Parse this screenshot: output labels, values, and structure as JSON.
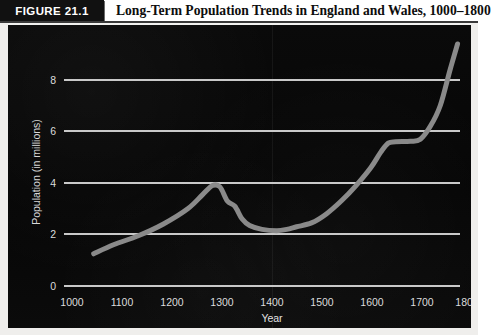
{
  "figure": {
    "badge_label": "FIGURE 21.1",
    "title": "Long-Term Population Trends in England and Wales, 1000–1800"
  },
  "chart_data": {
    "type": "line",
    "title": "Long-Term Population Trends in England and Wales, 1000–1800",
    "xlabel": "Year",
    "ylabel": "Population (in millions)",
    "xlim": [
      1000,
      1800
    ],
    "ylim": [
      0,
      10
    ],
    "grid": "horizontal",
    "legend": "none",
    "line_color": "#8a8a8a",
    "background_color": "#080808",
    "gridline_color": "#c9c9c9",
    "x_ticks": [
      "1000",
      "1100",
      "1200",
      "1300",
      "1400",
      "1500",
      "1600",
      "1700",
      "1800"
    ],
    "y_ticks": [
      "0",
      "2",
      "4",
      "6",
      "8"
    ],
    "x": [
      1060,
      1100,
      1150,
      1200,
      1250,
      1280,
      1300,
      1315,
      1330,
      1345,
      1360,
      1375,
      1400,
      1430,
      1450,
      1470,
      1500,
      1530,
      1560,
      1590,
      1620,
      1640,
      1655,
      1670,
      1700,
      1720,
      1740,
      1760,
      1780,
      1795
    ],
    "values": [
      1.25,
      1.6,
      1.95,
      2.4,
      3.0,
      3.55,
      3.9,
      3.85,
      3.3,
      3.1,
      2.6,
      2.35,
      2.2,
      2.15,
      2.2,
      2.3,
      2.45,
      2.8,
      3.3,
      3.9,
      4.6,
      5.2,
      5.55,
      5.6,
      5.62,
      5.7,
      6.2,
      7.0,
      8.4,
      9.4
    ],
    "series_name": "Population of England and Wales",
    "annotations": [
      {
        "label": "pre-plague peak",
        "x": 1300,
        "y": 3.9
      },
      {
        "label": "post-plague trough",
        "x": 1430,
        "y": 2.15
      },
      {
        "label": "late-17th-century plateau",
        "x": 1680,
        "y": 5.6
      },
      {
        "label": "industrial-era surge",
        "x": 1795,
        "y": 9.4
      }
    ]
  },
  "axes": {
    "y_ticks": [
      {
        "label": "8",
        "value": 8
      },
      {
        "label": "6",
        "value": 6
      },
      {
        "label": "4",
        "value": 4
      },
      {
        "label": "2",
        "value": 2
      },
      {
        "label": "0",
        "value": 0
      }
    ],
    "x_ticks": [
      {
        "label": "1000",
        "value": 1000
      },
      {
        "label": "1100",
        "value": 1100
      },
      {
        "label": "1200",
        "value": 1200
      },
      {
        "label": "1300",
        "value": 1300
      },
      {
        "label": "1400",
        "value": 1400
      },
      {
        "label": "1500",
        "value": 1500
      },
      {
        "label": "1600",
        "value": 1600
      },
      {
        "label": "1700",
        "value": 1700
      },
      {
        "label": "1800",
        "value": 1800
      }
    ],
    "x_axis_title": "Year",
    "y_axis_title": "Population (in millions)"
  }
}
